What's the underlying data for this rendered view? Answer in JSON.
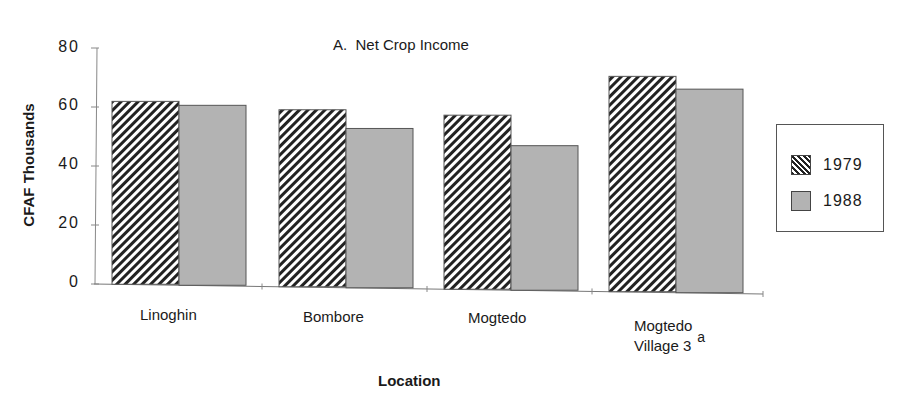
{
  "chart_data": {
    "type": "bar",
    "title": "A.  Net Crop Income",
    "xlabel": "Location",
    "ylabel": "CFAF Thousands",
    "ylim": [
      0,
      80
    ],
    "yticks": [
      0,
      20,
      40,
      60,
      80
    ],
    "grid": false,
    "legend_position": "right",
    "categories": [
      "Linoghin",
      "Bombore",
      "Mogtedo",
      "Mogtedo Village 3 a"
    ],
    "series": [
      {
        "name": "1979",
        "pattern": "diagonal-hatch",
        "color": "#222222",
        "values": [
          62,
          60,
          59,
          73
        ]
      },
      {
        "name": "1988",
        "pattern": "gray-fill",
        "color": "#b3b3b3",
        "values": [
          61,
          54,
          49,
          69
        ]
      }
    ]
  },
  "labels": {
    "title": "A.  Net Crop Income",
    "ylabel": "CFAF Thousands",
    "xlabel": "Location",
    "yticks": [
      "80",
      "60",
      "40",
      "20",
      "0"
    ],
    "categories": [
      {
        "line1": "Linoghin",
        "line2": "",
        "sup": ""
      },
      {
        "line1": "Bombore",
        "line2": "",
        "sup": ""
      },
      {
        "line1": "Mogtedo",
        "line2": "",
        "sup": ""
      },
      {
        "line1": "Mogtedo",
        "line2": "Village 3",
        "sup": "a"
      }
    ],
    "legend": [
      "1979",
      "1988"
    ]
  }
}
